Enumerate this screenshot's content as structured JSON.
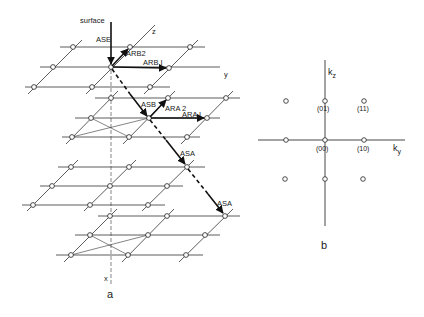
{
  "figure": {
    "panel_a": {
      "label": "a",
      "surface_label": "surface",
      "axis_labels": {
        "z": "z",
        "y": "y",
        "x": "x"
      },
      "vector_labels": {
        "ase": "ASE",
        "arb2": "ARB2",
        "arb1": "ARB I",
        "asb": "ASB",
        "ara2": "ARA 2",
        "ara1": "ARA I",
        "asa_upper": "ASA",
        "asa_lower": "ASA"
      },
      "layers": [
        {
          "name": "layer-1",
          "rows": [
            {
              "y": 47,
              "xs": [
                73,
                130,
                190
              ]
            },
            {
              "y": 67,
              "xs": [
                53,
                111,
                169
              ]
            },
            {
              "y": 87,
              "xs": [
                34,
                92,
                150
              ]
            }
          ]
        },
        {
          "name": "layer-2",
          "rows": [
            {
              "y": 98,
              "xs": [
                111,
                168,
                226
              ]
            },
            {
              "y": 118,
              "xs": [
                91,
                149,
                207
              ]
            },
            {
              "y": 137,
              "xs": [
                72,
                129,
                187
              ]
            }
          ]
        },
        {
          "name": "layer-3",
          "rows": [
            {
              "y": 167,
              "xs": [
                71,
                129,
                187
              ]
            },
            {
              "y": 186,
              "xs": [
                52,
                110,
                167
              ]
            },
            {
              "y": 205,
              "xs": [
                33,
                90,
                148
              ]
            }
          ]
        },
        {
          "name": "layer-4",
          "rows": [
            {
              "y": 216,
              "xs": [
                110,
                167,
                225
              ]
            },
            {
              "y": 235,
              "xs": [
                90,
                148,
                205
              ]
            },
            {
              "y": 255,
              "xs": [
                71,
                128,
                186
              ]
            }
          ]
        }
      ]
    },
    "panel_b": {
      "label": "b",
      "axis_labels": {
        "kz": "k",
        "kz_sub": "z",
        "ky": "k",
        "ky_sub": "y"
      },
      "spots": [
        {
          "x": 286,
          "y": 101,
          "label": ""
        },
        {
          "x": 325,
          "y": 101,
          "label": "(01)"
        },
        {
          "x": 364,
          "y": 101,
          "label": "(11)"
        },
        {
          "x": 286,
          "y": 140,
          "label": ""
        },
        {
          "x": 325,
          "y": 140,
          "label": "(00)"
        },
        {
          "x": 364,
          "y": 140,
          "label": "(10)"
        },
        {
          "x": 285,
          "y": 179,
          "label": ""
        },
        {
          "x": 325,
          "y": 179,
          "label": ""
        },
        {
          "x": 364,
          "y": 179,
          "label": ""
        }
      ]
    }
  }
}
